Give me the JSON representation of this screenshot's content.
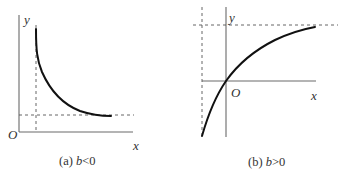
{
  "figure": {
    "panels": [
      {
        "id": "a",
        "caption_prefix": "(a) ",
        "caption_var": "b",
        "caption_cond": "<0",
        "labels": {
          "y_axis": "y",
          "origin": "O",
          "x_axis": "x"
        },
        "description": "Decreasing curve with vertical asymptote (dashed) on the right of the y-axis and horizontal asymptote (dashed) above the x-axis"
      },
      {
        "id": "b",
        "caption_prefix": "(b) ",
        "caption_var": "b",
        "caption_cond": ">0",
        "labels": {
          "y_axis": "y",
          "origin": "O",
          "x_axis": "x"
        },
        "description": "Increasing concave curve through the origin with vertical asymptote (dashed) left of the y-axis and horizontal asymptote (dashed) above"
      }
    ],
    "colors": {
      "curve": "#111111",
      "axis": "#6a6a6a",
      "dash": "#555555",
      "text": "#333333"
    }
  }
}
